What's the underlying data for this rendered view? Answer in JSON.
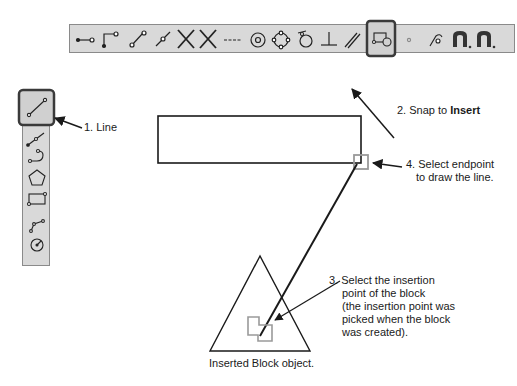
{
  "horizontal_toolbar": {
    "items": [
      {
        "name": "endpoint-snap-icon"
      },
      {
        "name": "midpoint-snap-icon"
      },
      {
        "name": "line-midpoint-snap-icon"
      },
      {
        "name": "line-center-snap-icon"
      },
      {
        "name": "intersection-snap-icon"
      },
      {
        "name": "apparent-intersection-snap-icon"
      },
      {
        "name": "extension-snap-icon"
      },
      {
        "name": "center-snap-icon"
      },
      {
        "name": "quadrant-snap-icon"
      },
      {
        "name": "tangent-snap-icon"
      },
      {
        "name": "perpendicular-snap-icon"
      },
      {
        "name": "parallel-snap-icon"
      },
      {
        "name": "insert-snap-icon",
        "selected": true
      },
      {
        "name": "node-snap-icon"
      },
      {
        "name": "nearest-snap-icon"
      },
      {
        "name": "snap-settings-icon"
      },
      {
        "name": "snap-toggle-icon"
      }
    ]
  },
  "vertical_toolbar": {
    "items": [
      {
        "name": "line-tool-icon",
        "selected": true
      },
      {
        "name": "polyline-tool-icon"
      },
      {
        "name": "arc-tool-icon"
      },
      {
        "name": "polygon-tool-icon"
      },
      {
        "name": "rectangle-tool-icon"
      },
      {
        "name": "spline-tool-icon"
      },
      {
        "name": "circle-tool-icon"
      }
    ]
  },
  "annotations": {
    "step1": "1. Line",
    "step2_prefix": "2. Snap to ",
    "step2_bold": "Insert",
    "step3_lines": [
      "3. Select the insertion",
      "point of the block",
      "(the insertion point was",
      "picked when the block",
      "was created)."
    ],
    "step4_lines": [
      "4. Select endpoint",
      "to draw the line."
    ],
    "block_caption": "Inserted Block object."
  },
  "colors": {
    "toolbar_bg": "#d9d9d9",
    "toolbar_border": "#8a8a8a",
    "selected_frame": "#3a3a3a",
    "snap_marker": "#9a9a9a",
    "ink": "#1a1a1a"
  }
}
